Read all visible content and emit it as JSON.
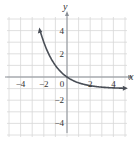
{
  "chart_data": {
    "type": "line",
    "title": "",
    "xlabel": "x",
    "ylabel": "y",
    "xlim": [
      -5,
      5
    ],
    "ylim": [
      -5,
      5
    ],
    "grid": true,
    "x_ticks": [
      "-4",
      "-2",
      "0",
      "2",
      "4"
    ],
    "y_ticks": [
      "4",
      "2",
      "-2",
      "-4"
    ],
    "series": [
      {
        "name": "y = 2^(-x) - 1",
        "x": [
          -2.3,
          -2,
          -1.5,
          -1,
          -0.5,
          0,
          0.5,
          1,
          1.5,
          2,
          3,
          4,
          5
        ],
        "y": [
          3.92,
          3.0,
          1.83,
          1.0,
          0.41,
          0.0,
          -0.29,
          -0.5,
          -0.65,
          -0.75,
          -0.875,
          -0.94,
          -0.97
        ]
      }
    ],
    "asymptote": {
      "y": -1
    },
    "colors": {
      "curve": "#4a4f57",
      "grid": "#d8d8d8",
      "axis": "#8a8f96"
    }
  }
}
